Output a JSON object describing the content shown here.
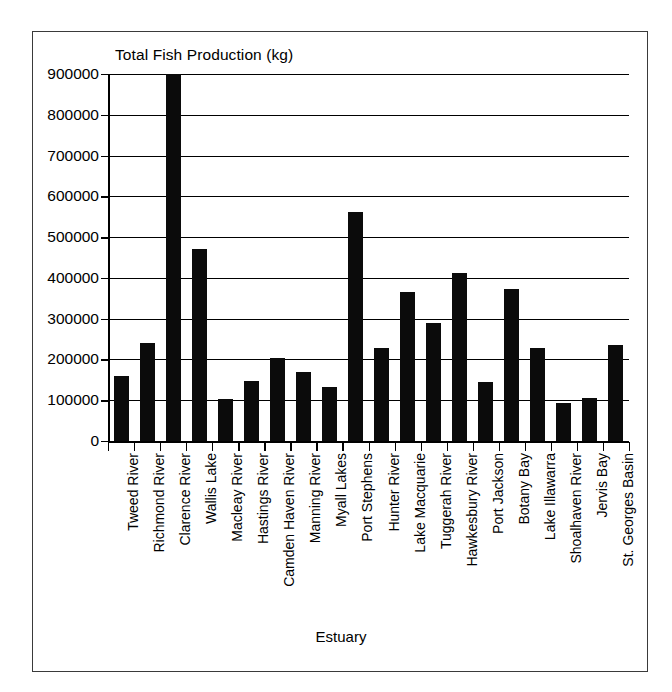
{
  "chart_data": {
    "type": "bar",
    "title": "Total Fish Production (kg)",
    "xlabel": "Estuary",
    "ylabel": "",
    "ylim": [
      0,
      900000
    ],
    "ytick_step": 100000,
    "yticks": [
      900000,
      800000,
      700000,
      600000,
      500000,
      400000,
      300000,
      200000,
      100000,
      0
    ],
    "ytick_labels": [
      "900000",
      "800000",
      "700000",
      "600000",
      "500000",
      "400000",
      "300000",
      "200000",
      "100000",
      "0"
    ],
    "grid": true,
    "legend": null,
    "bar_color": "#0b0b0b",
    "categories": [
      "Tweed River",
      "Richmond River",
      "Clarence River",
      "Wallis Lake",
      "Macleay River",
      "Hastings River",
      "Camden Haven River",
      "Manning River",
      "Myall Lakes",
      "Port Stephens",
      "Hunter River",
      "Lake Macquarie",
      "Tuggerah River",
      "Hawkesbury River",
      "Port Jackson",
      "Botany Bay",
      "Lake Illawarra",
      "Shoalhaven River",
      "Jervis Bay",
      "St. Georges Basin"
    ],
    "values": [
      160000,
      240000,
      920000,
      470000,
      103000,
      147000,
      203000,
      170000,
      132000,
      562000,
      228000,
      365000,
      290000,
      412000,
      145000,
      372000,
      227000,
      93000,
      105000,
      235000
    ]
  },
  "figure": {
    "frame_color": "#3a3a3a"
  }
}
